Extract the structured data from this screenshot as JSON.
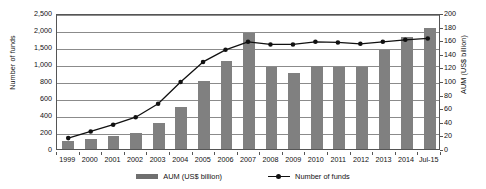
{
  "chart_data": {
    "type": "bar",
    "title": "",
    "subtitle": "",
    "xlabel": "",
    "ylabel": "Number of funds",
    "ylabel_right": "AUM (US$ billion)",
    "grid": true,
    "legend_position": "bottom",
    "categories": [
      "1999",
      "2000",
      "2001",
      "2002",
      "2003",
      "2004",
      "2005",
      "2006",
      "2007",
      "2008",
      "2009",
      "2010",
      "2011",
      "2012",
      "2013",
      "2014",
      "Jul-15"
    ],
    "left_axis": {
      "label": "Number of funds",
      "ticks": [
        "0",
        "200",
        "400",
        "600",
        "800",
        "1,000",
        "1,500",
        "2,000",
        "2,500"
      ],
      "tick_values": [
        0,
        200,
        400,
        600,
        800,
        1000,
        1500,
        2000,
        2500
      ],
      "ylim": [
        0,
        2500
      ],
      "note": "tick labels are unevenly valued but drawn at evenly spaced gridlines"
    },
    "right_axis": {
      "label": "AUM (US$ billion)",
      "ticks": [
        "0",
        "20",
        "40",
        "60",
        "80",
        "100",
        "120",
        "140",
        "160",
        "180",
        "200"
      ],
      "tick_values": [
        0,
        20,
        40,
        60,
        80,
        100,
        120,
        140,
        160,
        180,
        200
      ],
      "ylim": [
        0,
        200
      ]
    },
    "series": [
      {
        "name": "AUM (US$ billion)",
        "type": "bar",
        "axis": "right",
        "unit": "US$ billion",
        "color": "#808080",
        "values": [
          12,
          15,
          19,
          24,
          38,
          62,
          100,
          130,
          170,
          120,
          112,
          122,
          120,
          120,
          145,
          165,
          178
        ]
      },
      {
        "name": "Number of funds",
        "type": "line",
        "axis": "left",
        "color": "#111111",
        "marker": "circle",
        "values": [
          130,
          210,
          290,
          380,
          540,
          800,
          1100,
          1460,
          1700,
          1620,
          1620,
          1700,
          1680,
          1640,
          1700,
          1760,
          1800
        ]
      }
    ]
  },
  "legend": {
    "entries": [
      {
        "label": "AUM (US$ billion)",
        "marker": "bar-swatch"
      },
      {
        "label": "Number of funds",
        "marker": "line-marker"
      }
    ]
  },
  "colors": {
    "bar": "#808080",
    "line": "#111111",
    "grid": "#8b8b8b",
    "frame": "#555555",
    "background": "#ffffff"
  }
}
